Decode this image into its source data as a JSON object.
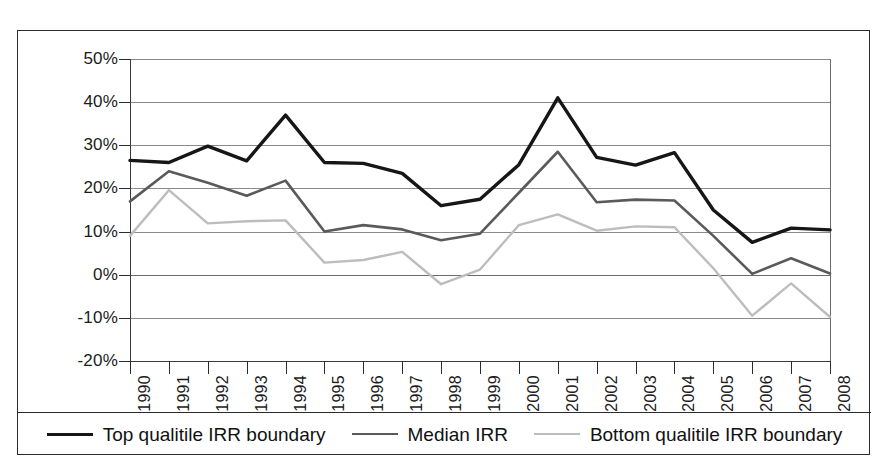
{
  "chart_data": {
    "type": "line",
    "title": "",
    "xlabel": "",
    "ylabel": "",
    "ylim": [
      -20,
      50
    ],
    "yticks": [
      "50%",
      "40%",
      "30%",
      "20%",
      "10%",
      "0%",
      "-10%",
      "-20%"
    ],
    "ytick_values": [
      50,
      40,
      30,
      20,
      10,
      0,
      -10,
      -20
    ],
    "grid": true,
    "legend_position": "bottom",
    "categories": [
      "1990",
      "1991",
      "1992",
      "1993",
      "1994",
      "1995",
      "1996",
      "1997",
      "1998",
      "1999",
      "2000",
      "2001",
      "2002",
      "2003",
      "2004",
      "2005",
      "2006",
      "2007",
      "2008"
    ],
    "series": [
      {
        "name": "Top qualitile IRR boundary",
        "color": "#161616",
        "values": [
          26.5,
          26.0,
          29.8,
          26.4,
          37.0,
          26.0,
          25.8,
          23.5,
          16.0,
          17.5,
          25.5,
          41.0,
          27.2,
          25.4,
          28.3,
          15.0,
          7.5,
          10.8,
          10.4
        ]
      },
      {
        "name": "Median IRR",
        "color": "#5a5a5a",
        "values": [
          17.0,
          24.0,
          21.3,
          18.3,
          21.8,
          10.0,
          11.5,
          10.5,
          8.0,
          9.5,
          19.0,
          28.5,
          16.8,
          17.4,
          17.2,
          9.0,
          0.2,
          3.8,
          0.3
        ]
      },
      {
        "name": "Bottom qualitile IRR boundary",
        "color": "#bdbdbd",
        "values": [
          9.0,
          19.6,
          11.9,
          12.4,
          12.6,
          2.8,
          3.4,
          5.3,
          -2.2,
          1.2,
          11.5,
          14.0,
          10.2,
          11.2,
          11.0,
          1.5,
          -9.5,
          -2.0,
          -9.8
        ]
      }
    ]
  },
  "legend": {
    "items": [
      {
        "label": "Top qualitile IRR boundary",
        "color": "#161616",
        "width": 3.4
      },
      {
        "label": "Median IRR",
        "color": "#5a5a5a",
        "width": 2.6
      },
      {
        "label": "Bottom qualitile IRR boundary",
        "color": "#bdbdbd",
        "width": 2.4
      }
    ]
  }
}
